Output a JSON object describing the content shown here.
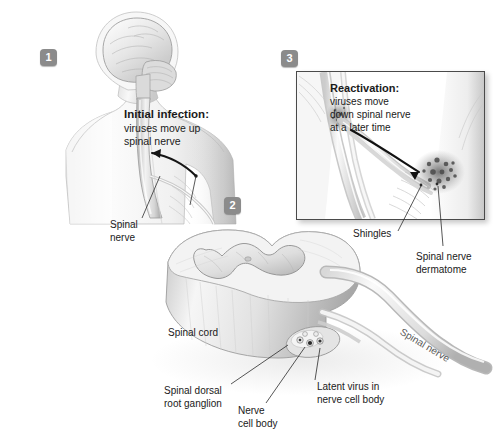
{
  "figure": {
    "background_color": "#ffffff",
    "ink_color": "#1a1a1a",
    "badge_color": "#8b8b8b"
  },
  "badges": {
    "one": "1",
    "two": "2",
    "three": "3"
  },
  "callouts": {
    "initial": {
      "heading": "Initial infection:",
      "line1": "viruses move up",
      "line2": "spinal nerve"
    },
    "reactivation": {
      "heading": "Reactivation:",
      "line1": "viruses move",
      "line2": "down spinal nerve",
      "line3": "at a later time"
    }
  },
  "labels": {
    "spinal_nerve_panel1_l1": "Spinal",
    "spinal_nerve_panel1_l2": "nerve",
    "shingles": "Shingles",
    "dermatome_l1": "Spinal nerve",
    "dermatome_l2": "dermatome",
    "spinal_cord": "Spinal cord",
    "ganglion_l1": "Spinal dorsal",
    "ganglion_l2": "root ganglion",
    "nerve_cell_body_l1": "Nerve",
    "nerve_cell_body_l2": "cell body",
    "latent_l1": "Latent virus in",
    "latent_l2": "nerve cell body",
    "spinal_nerve_panel2": "Spinal nerve"
  }
}
